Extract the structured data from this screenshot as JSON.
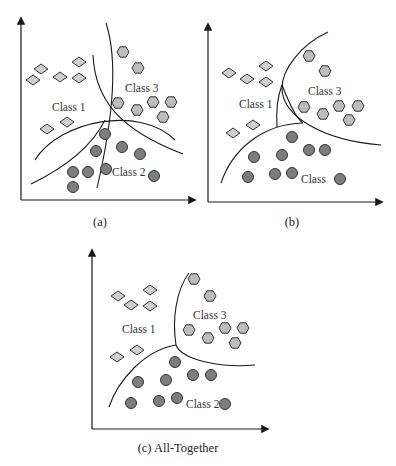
{
  "colors": {
    "class1_fill": "#cfcfcf",
    "class3_fill": "#bdbdbd",
    "class2_fill": "#7d7d7d",
    "stroke": "#333333"
  },
  "legend_shapes": {
    "class1": "diamond",
    "class2": "circle",
    "class3": "hexagon"
  },
  "panels": [
    {
      "id": "a",
      "caption": "(a)",
      "labels": {
        "class1": "Class 1",
        "class2": "Class 2",
        "class3": "Class 3"
      },
      "boundaries": 3
    },
    {
      "id": "b",
      "caption": "(b)",
      "labels": {
        "class1": "Class 1",
        "class2": "Class",
        "class3": "Class 3"
      },
      "boundaries": 3
    },
    {
      "id": "c",
      "caption": "(c) All-Together",
      "labels": {
        "class1": "Class 1",
        "class2": "Class 2",
        "class3": "Class 3"
      },
      "boundaries": 3
    }
  ]
}
